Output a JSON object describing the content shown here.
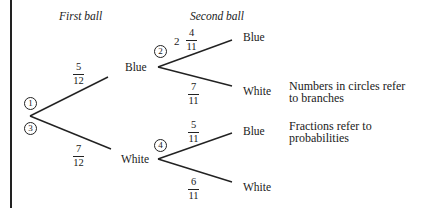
{
  "headers": {
    "first": "First ball",
    "second": "Second ball"
  },
  "nodes": [
    {
      "id": "1",
      "label": "1"
    },
    {
      "id": "2",
      "label": "2"
    },
    {
      "id": "3",
      "label": "3"
    },
    {
      "id": "4",
      "label": "4"
    }
  ],
  "outcomes": {
    "first_blue": "Blue",
    "first_white": "White",
    "blue_blue": "Blue",
    "blue_white": "White",
    "white_blue": "Blue",
    "white_white": "White"
  },
  "probabilities": {
    "first_blue": {
      "num": "5",
      "den": "12"
    },
    "first_white": {
      "num": "7",
      "den": "12"
    },
    "blue_blue": {
      "prefix": "2",
      "num": "4",
      "den": "11"
    },
    "blue_white": {
      "num": "7",
      "den": "11"
    },
    "white_blue": {
      "num": "5",
      "den": "11"
    },
    "white_white": {
      "num": "6",
      "den": "11"
    }
  },
  "notes": {
    "circles_line1": "Numbers in circles refer",
    "circles_line2": "to branches",
    "fractions_line1": "Fractions refer to",
    "fractions_line2": "probabilities"
  }
}
